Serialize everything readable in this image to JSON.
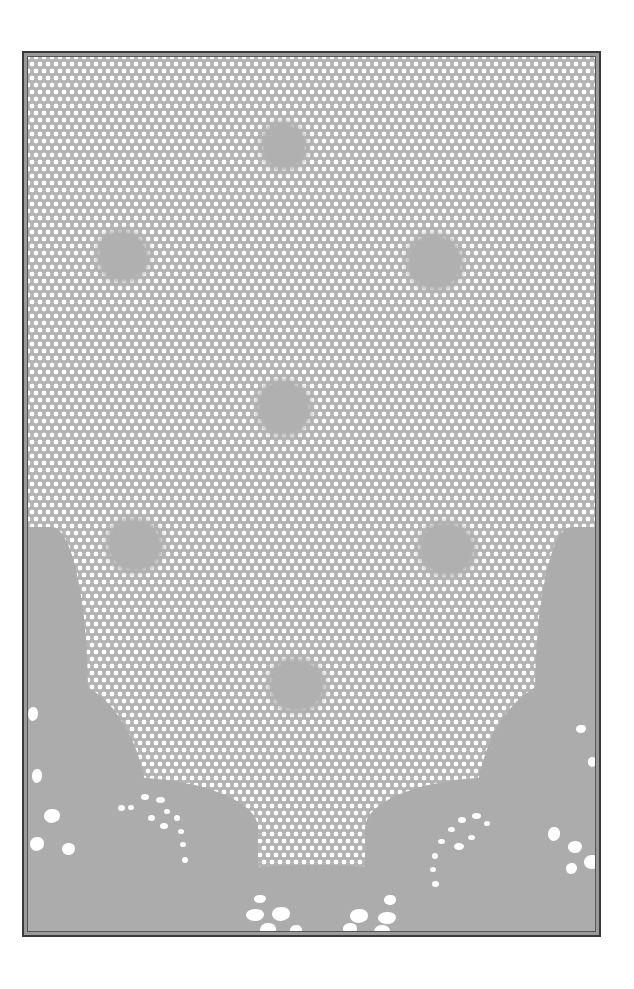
{
  "image": {
    "subject": "photograph of lace fabric with hexagonal net mesh and floral motifs",
    "colors": {
      "background": "#ffffff",
      "frame_border": "#3a3a3a",
      "mesh_gray": "#b3b3b3",
      "solid_gray": "#acacac",
      "holes": "#ffffff"
    },
    "motifs": [
      {
        "x": 262,
        "y": 120,
        "w": 40,
        "h": 42
      },
      {
        "x": 98,
        "y": 228,
        "w": 46,
        "h": 46
      },
      {
        "x": 408,
        "y": 232,
        "w": 50,
        "h": 50
      },
      {
        "x": 258,
        "y": 378,
        "w": 48,
        "h": 50
      },
      {
        "x": 108,
        "y": 516,
        "w": 50,
        "h": 48
      },
      {
        "x": 420,
        "y": 520,
        "w": 50,
        "h": 48
      },
      {
        "x": 270,
        "y": 656,
        "w": 50,
        "h": 48
      }
    ]
  }
}
